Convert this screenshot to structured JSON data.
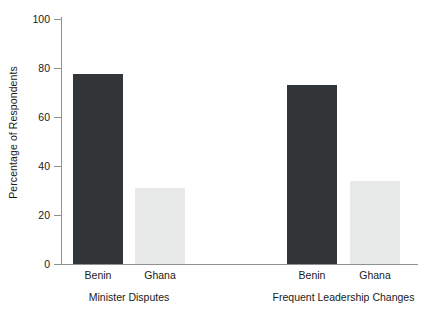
{
  "chart_data": {
    "type": "bar",
    "title": "",
    "xlabel": "",
    "ylabel": "Percentage of Respondents",
    "ylim": [
      0,
      100
    ],
    "yticks": [
      0,
      20,
      40,
      60,
      80,
      100
    ],
    "grid": false,
    "legend": "none",
    "categories": [
      "Minister Disputes",
      "Frequent Leadership Changes"
    ],
    "subcategories": [
      "Benin",
      "Ghana"
    ],
    "series": [
      {
        "name": "Benin",
        "color": "#333638",
        "values": [
          77.5,
          73
        ]
      },
      {
        "name": "Ghana",
        "color": "#e8e9e9",
        "values": [
          31,
          34
        ]
      }
    ],
    "bars": [
      {
        "group": "Minister Disputes",
        "country": "Benin",
        "value": 77.5,
        "color": "#333638"
      },
      {
        "group": "Minister Disputes",
        "country": "Ghana",
        "value": 31,
        "color": "#e8e9e9"
      },
      {
        "group": "Frequent Leadership Changes",
        "country": "Benin",
        "value": 73,
        "color": "#333638"
      },
      {
        "group": "Frequent Leadership Changes",
        "country": "Ghana",
        "value": 34,
        "color": "#e8e9e9"
      }
    ]
  },
  "axis": {
    "y_title": "Percentage of Respondents",
    "tick_labels": [
      "100",
      "80",
      "60",
      "40",
      "20",
      "0"
    ]
  },
  "bar_labels": [
    "Benin",
    "Ghana",
    "Benin",
    "Ghana"
  ],
  "group_labels": [
    "Minister Disputes",
    "Frequent Leadership Changes"
  ],
  "colors": {
    "benin_bar": "#333638",
    "ghana_bar": "#e8e9e9",
    "axis": "#8e9093",
    "text": "#1a1a1a",
    "background": "#ffffff"
  }
}
